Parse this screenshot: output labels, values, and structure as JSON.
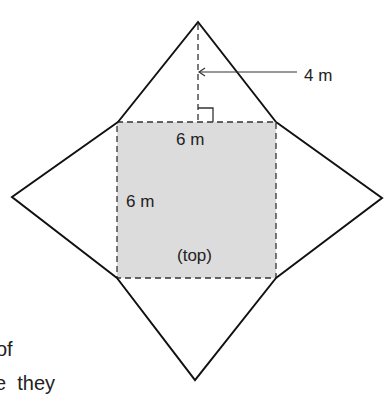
{
  "diagram": {
    "type": "pyramid-net",
    "colors": {
      "stroke": "#111111",
      "top_fill": "#dcdcdc",
      "background": "#ffffff"
    },
    "labels": {
      "slant_height": "4 m",
      "top_width": "6 m",
      "side_length": "6 m",
      "top_face": "(top)"
    },
    "cut_text": {
      "line1": "of",
      "line2": "e  they"
    }
  }
}
